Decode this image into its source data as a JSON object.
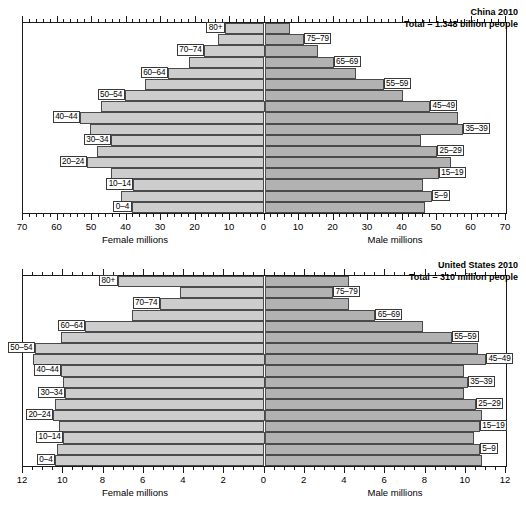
{
  "charts": [
    {
      "id": "china",
      "title_line1": "China 2010",
      "title_line2": "Total = 1.348 billion people",
      "left_caption": "Female millions",
      "right_caption": "Male millions",
      "axis_max": 70,
      "tick_labels": [
        "70",
        "60",
        "50",
        "40",
        "30",
        "20",
        "10",
        "0",
        "10",
        "20",
        "30",
        "40",
        "50",
        "60",
        "70"
      ],
      "tick_values": [
        -70,
        -60,
        -50,
        -40,
        -30,
        -20,
        -10,
        0,
        10,
        20,
        30,
        40,
        50,
        60,
        70
      ],
      "minor_step": 2,
      "age_groups": [
        "80+",
        "75–79",
        "70–74",
        "65–69",
        "60–64",
        "55–59",
        "50–54",
        "45–49",
        "40–44",
        "35–39",
        "30–34",
        "25–29",
        "20–24",
        "15–19",
        "10–14",
        "5–9",
        "0–4"
      ],
      "female": [
        11.5,
        13.5,
        17.5,
        22.0,
        28.0,
        34.5,
        40.5,
        47.5,
        53.5,
        50.5,
        44.5,
        48.5,
        51.5,
        44.5,
        38.0,
        41.5,
        38.5
      ],
      "male": [
        7.5,
        11.5,
        15.5,
        20.0,
        26.5,
        34.5,
        40.0,
        48.0,
        56.0,
        57.5,
        45.5,
        50.0,
        54.0,
        50.5,
        46.0,
        48.5,
        46.5
      ],
      "label_side": [
        "left",
        "right",
        "left",
        "right",
        "left",
        "right",
        "left",
        "right",
        "left",
        "right",
        "left",
        "right",
        "left",
        "right",
        "left",
        "right",
        "left"
      ]
    },
    {
      "id": "united-states",
      "title_line1": "United States 2010",
      "title_line2": "Total = 310 million people",
      "left_caption": "Female millions",
      "right_caption": "Male millions",
      "axis_max": 12,
      "tick_labels": [
        "12",
        "10",
        "8",
        "6",
        "4",
        "2",
        "0",
        "2",
        "4",
        "6",
        "8",
        "10",
        "12"
      ],
      "tick_values": [
        -12,
        -10,
        -8,
        -6,
        -4,
        -2,
        0,
        2,
        4,
        6,
        8,
        10,
        12
      ],
      "minor_step": 0.5,
      "age_groups": [
        "80+",
        "75–79",
        "70–74",
        "65–69",
        "60–64",
        "55–59",
        "50–54",
        "45–49",
        "40–44",
        "35–39",
        "30–34",
        "25–29",
        "20–24",
        "15–19",
        "10–14",
        "5–9",
        "0–4"
      ],
      "female": [
        7.3,
        4.2,
        5.2,
        6.6,
        8.9,
        10.1,
        11.4,
        11.5,
        10.1,
        10.0,
        9.9,
        10.4,
        10.5,
        10.2,
        10.0,
        10.3,
        10.4
      ],
      "male": [
        4.2,
        3.4,
        4.2,
        5.5,
        7.9,
        9.3,
        10.6,
        11.0,
        9.9,
        10.1,
        9.9,
        10.5,
        10.8,
        10.7,
        10.4,
        10.7,
        10.8
      ],
      "label_side": [
        "left",
        "right",
        "left",
        "right",
        "left",
        "right",
        "left",
        "right",
        "left",
        "right",
        "left",
        "right",
        "left",
        "right",
        "left",
        "right",
        "left"
      ]
    }
  ],
  "chart_data": {
    "type": "bar",
    "subtype": "population-pyramid",
    "panels": [
      {
        "title": "China 2010",
        "subtitle": "Total = 1.348 billion people",
        "xlabel_left": "Female millions",
        "xlabel_right": "Male millions",
        "ylabel": "Age group",
        "xlim": [
          -70,
          70
        ],
        "xticks": [
          -70,
          -60,
          -50,
          -40,
          -30,
          -20,
          -10,
          0,
          10,
          20,
          30,
          40,
          50,
          60,
          70
        ],
        "xticklabels": [
          "70",
          "60",
          "50",
          "40",
          "30",
          "20",
          "10",
          "0",
          "10",
          "20",
          "30",
          "40",
          "50",
          "60",
          "70"
        ],
        "grid": false,
        "legend": "none",
        "categories": [
          "80+",
          "75–79",
          "70–74",
          "65–69",
          "60–64",
          "55–59",
          "50–54",
          "45–49",
          "40–44",
          "35–39",
          "30–34",
          "25–29",
          "20–24",
          "15–19",
          "10–14",
          "5–9",
          "0–4"
        ],
        "series": [
          {
            "name": "Female millions",
            "side": "left",
            "values": [
              11.5,
              13.5,
              17.5,
              22.0,
              28.0,
              34.5,
              40.5,
              47.5,
              53.5,
              50.5,
              44.5,
              48.5,
              51.5,
              44.5,
              38.0,
              41.5,
              38.5
            ]
          },
          {
            "name": "Male millions",
            "side": "right",
            "values": [
              7.5,
              11.5,
              15.5,
              20.0,
              26.5,
              34.5,
              40.0,
              48.0,
              56.0,
              57.5,
              45.5,
              50.0,
              54.0,
              50.5,
              46.0,
              48.5,
              46.5
            ]
          }
        ]
      },
      {
        "title": "United States 2010",
        "subtitle": "Total = 310 million people",
        "xlabel_left": "Female millions",
        "xlabel_right": "Male millions",
        "ylabel": "Age group",
        "xlim": [
          -12,
          12
        ],
        "xticks": [
          -12,
          -10,
          -8,
          -6,
          -4,
          -2,
          0,
          2,
          4,
          6,
          8,
          10,
          12
        ],
        "xticklabels": [
          "12",
          "10",
          "8",
          "6",
          "4",
          "2",
          "0",
          "2",
          "4",
          "6",
          "8",
          "10",
          "12"
        ],
        "grid": false,
        "legend": "none",
        "categories": [
          "80+",
          "75–79",
          "70–74",
          "65–69",
          "60–64",
          "55–59",
          "50–54",
          "45–49",
          "40–44",
          "35–39",
          "30–34",
          "25–29",
          "20–24",
          "15–19",
          "10–14",
          "5–9",
          "0–4"
        ],
        "series": [
          {
            "name": "Female millions",
            "side": "left",
            "values": [
              7.3,
              4.2,
              5.2,
              6.6,
              8.9,
              10.1,
              11.4,
              11.5,
              10.1,
              10.0,
              9.9,
              10.4,
              10.5,
              10.2,
              10.0,
              10.3,
              10.4
            ]
          },
          {
            "name": "Male millions",
            "side": "right",
            "values": [
              4.2,
              3.4,
              4.2,
              5.5,
              7.9,
              9.3,
              10.6,
              11.0,
              9.9,
              10.1,
              9.9,
              10.5,
              10.8,
              10.7,
              10.4,
              10.7,
              10.8
            ]
          }
        ]
      }
    ],
    "colors": {
      "female_bar": "#cdcdcd",
      "male_bar": "#b2b2b2",
      "bar_outline": "#4a4a4a",
      "axis": "#1a1a1a",
      "background": "#ffffff"
    }
  }
}
